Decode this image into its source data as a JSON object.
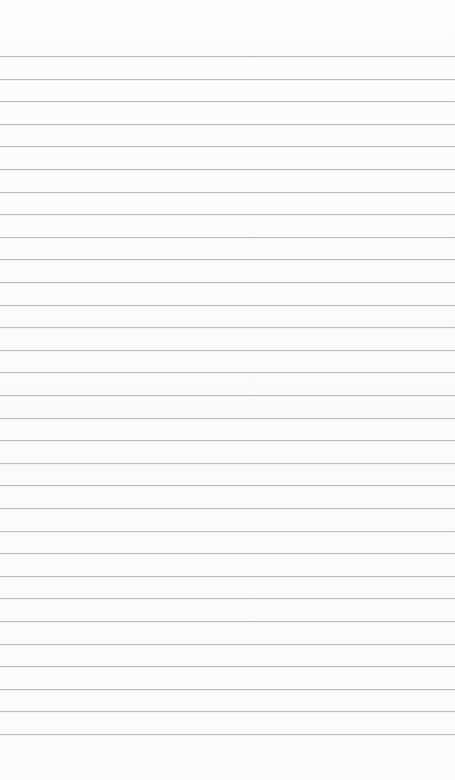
{
  "notepad": {
    "content": "",
    "background_color": "#fbfbfb",
    "rule_color": "#bcbcbc",
    "first_rule_y": 56,
    "rule_spacing": 22.6,
    "rule_count": 31
  }
}
